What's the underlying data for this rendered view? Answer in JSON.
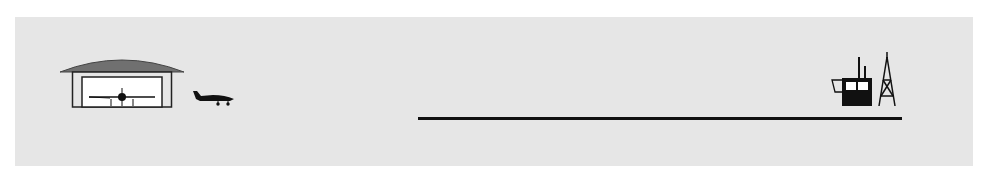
{
  "diagram": {
    "colors": {
      "background": "#e6e6e6",
      "ink": "#111111",
      "roof": "#707070",
      "hangar_interior": "#ffffff"
    },
    "elements": [
      {
        "id": "hangar",
        "label": "hangar-with-aircraft"
      },
      {
        "id": "taxiing-aircraft",
        "label": "aircraft-taxiing"
      },
      {
        "id": "runway",
        "label": "runway-line"
      },
      {
        "id": "control-tower",
        "label": "control-tower"
      },
      {
        "id": "radio-mast",
        "label": "radio-mast"
      }
    ]
  }
}
